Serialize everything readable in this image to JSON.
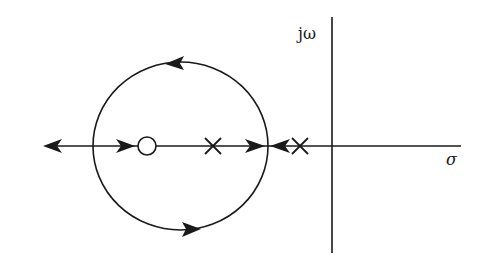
{
  "diagram": {
    "title": "",
    "type": "root-locus",
    "labels": {
      "imag_axis": "jω",
      "real_axis": "σ"
    },
    "colors": {
      "stroke": "#1a1a1a",
      "background": "#ffffff"
    },
    "geometry": {
      "real_axis": {
        "x1": 43,
        "x2": 461,
        "y": 146
      },
      "imag_axis": {
        "x": 332,
        "y1": 17,
        "y2": 253
      },
      "circle": {
        "cx": 180.5,
        "cy": 146,
        "rx": 87.5,
        "ry": 84
      },
      "zeros": [
        {
          "x": 147,
          "y": 146,
          "r": 9
        }
      ],
      "poles": [
        {
          "x": 213,
          "y": 146
        },
        {
          "x": 300,
          "y": 146
        }
      ]
    },
    "elements": {
      "zeros": [
        {
          "label": "zero",
          "position": "on real axis, inside circle, left"
        }
      ],
      "poles": [
        {
          "label": "pole 1",
          "position": "on real axis, inside circle, right"
        },
        {
          "label": "pole 2",
          "position": "on real axis, just left of imaginary axis"
        }
      ],
      "arrows": [
        {
          "where": "real axis far left",
          "direction": "left"
        },
        {
          "where": "real axis toward zero",
          "direction": "right"
        },
        {
          "where": "real axis toward circle right break-in",
          "direction": "right"
        },
        {
          "where": "real axis from pole 2 toward circle",
          "direction": "left"
        },
        {
          "where": "upper arc",
          "direction": "left"
        },
        {
          "where": "lower arc",
          "direction": "right"
        }
      ]
    }
  }
}
